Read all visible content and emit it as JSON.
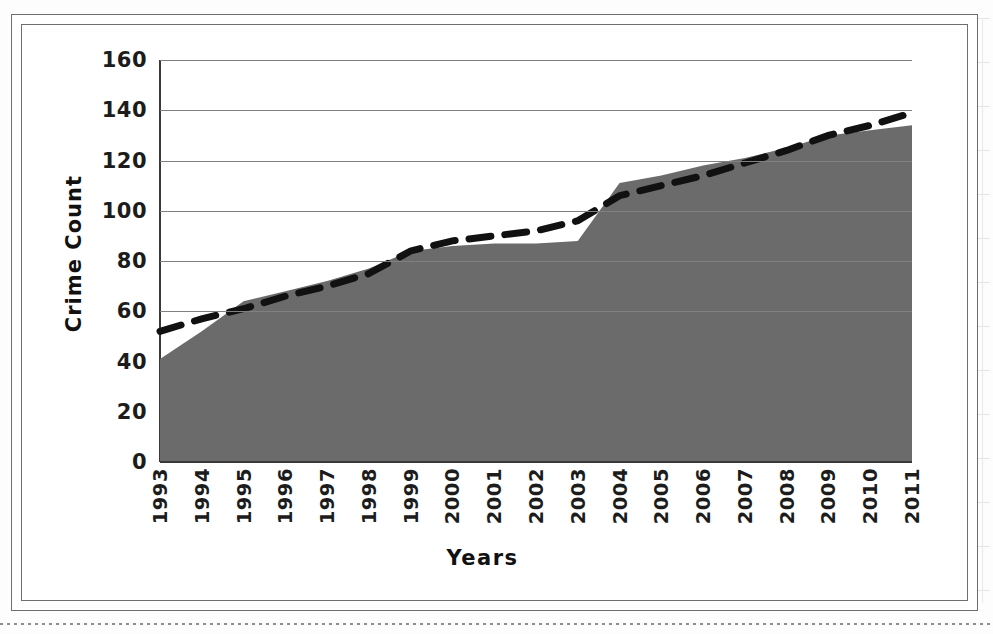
{
  "chart_data": {
    "type": "area",
    "title": "",
    "xlabel": "Years",
    "ylabel": "Crime Count",
    "ylim": [
      0,
      160
    ],
    "ytick_step": 20,
    "yticks": [
      "0",
      "20",
      "40",
      "60",
      "80",
      "100",
      "120",
      "140",
      "160"
    ],
    "grid": true,
    "legend": "none",
    "categories": [
      "1993",
      "1994",
      "1995",
      "1996",
      "1997",
      "1998",
      "1999",
      "2000",
      "2001",
      "2002",
      "2003",
      "2004",
      "2005",
      "2006",
      "2007",
      "2008",
      "2009",
      "2010",
      "2011"
    ],
    "series": [
      {
        "name": "Crime Count",
        "kind": "area",
        "color": "#6b6b6b",
        "values": [
          41,
          52,
          64,
          68,
          72,
          77,
          84,
          86,
          87,
          87,
          88,
          111,
          114,
          118,
          121,
          125,
          130,
          132,
          134
        ]
      },
      {
        "name": "Linear trendline",
        "kind": "dashed-line",
        "color": "#111111",
        "values": [
          52,
          57,
          61,
          66,
          70,
          75,
          84,
          88,
          90,
          92,
          96,
          106,
          110,
          114,
          119,
          124,
          130,
          134,
          139
        ]
      }
    ]
  },
  "axis": {
    "y_title": "Crime Count",
    "x_title": "Years"
  },
  "colors": {
    "area_fill": "#6b6b6b",
    "trend_line": "#111111",
    "gridline": "#808080",
    "frame": "#6e6e6e",
    "text": "#1c1c1c"
  }
}
